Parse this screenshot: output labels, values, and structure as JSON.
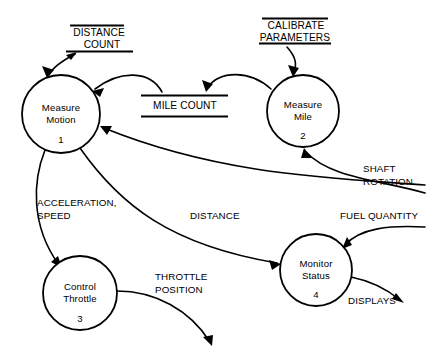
{
  "diagram": {
    "type": "data-flow-diagram",
    "background_color": "#ffffff",
    "line_color": "#000000"
  },
  "processes": [
    {
      "id": "measure-motion",
      "line1": "Measure",
      "line2": "Motion",
      "number": "1",
      "cx": 61,
      "cy": 114,
      "r": 39
    },
    {
      "id": "measure-mile",
      "line1": "Measure",
      "line2": "Mile",
      "number": "2",
      "cx": 303,
      "cy": 111,
      "r": 36
    },
    {
      "id": "control-throttle",
      "line1": "Control",
      "line2": "Throttle",
      "number": "3",
      "cx": 80,
      "cy": 293,
      "r": 37
    },
    {
      "id": "monitor-status",
      "line1": "Monitor",
      "line2": "Status",
      "number": "4",
      "cx": 316,
      "cy": 270,
      "r": 36
    }
  ],
  "data_stores": [
    {
      "id": "distance-count",
      "line1": "DISTANCE",
      "line2": "COUNT"
    },
    {
      "id": "mile-count",
      "line1": "MILE COUNT",
      "line2": ""
    },
    {
      "id": "calibrate-parameters",
      "line1": "CALIBRATE",
      "line2": "PARAMETERS"
    }
  ],
  "flows": [
    {
      "id": "acceleration-speed",
      "line1": "ACCELERATION,",
      "line2": "SPEED",
      "from": "measure-motion",
      "to": "control-throttle"
    },
    {
      "id": "distance",
      "line1": "DISTANCE",
      "line2": "",
      "from": "measure-motion",
      "to": "monitor-status"
    },
    {
      "id": "shaft-rotation",
      "line1": "SHAFT",
      "line2": "ROTATION",
      "from": "external",
      "to": "measure-motion"
    },
    {
      "id": "fuel-quantity",
      "line1": "FUEL QUANTITY",
      "line2": "",
      "from": "external",
      "to": "monitor-status"
    },
    {
      "id": "throttle-position",
      "line1": "THROTTLE",
      "line2": "POSITION",
      "from": "control-throttle",
      "to": "external"
    },
    {
      "id": "displays",
      "line1": "DISPLAYS",
      "line2": "",
      "from": "monitor-status",
      "to": "external"
    }
  ]
}
